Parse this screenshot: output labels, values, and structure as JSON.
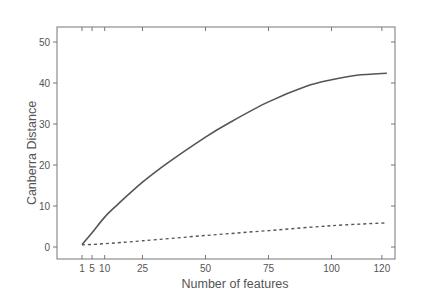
{
  "chart_data": {
    "type": "line",
    "title": "",
    "xlabel": "Number of features",
    "ylabel": "Canberra Distance",
    "xlim": [
      -12,
      135
    ],
    "ylim": [
      -3.5,
      53.5
    ],
    "x_ticks": [
      1,
      5,
      10,
      25,
      50,
      75,
      100,
      120
    ],
    "y_ticks": [
      0,
      10,
      20,
      30,
      40,
      50
    ],
    "grid": false,
    "legend": null,
    "series": [
      {
        "name": "solid",
        "style": "solid",
        "color": "#555555",
        "x": [
          1,
          5,
          10,
          15,
          25,
          35,
          50,
          60,
          75,
          90,
          100,
          110,
          122
        ],
        "values": [
          0.6,
          3.5,
          7.3,
          10.3,
          15.8,
          20.5,
          26.8,
          30.5,
          35.4,
          39.2,
          40.8,
          41.9,
          42.4
        ]
      },
      {
        "name": "dashed",
        "style": "dashed",
        "color": "#555555",
        "x": [
          1,
          10,
          25,
          50,
          75,
          100,
          122
        ],
        "values": [
          0.5,
          0.8,
          1.5,
          2.8,
          4.0,
          5.2,
          5.9
        ]
      }
    ]
  },
  "colors": {
    "axis": "#777777",
    "text": "#555555",
    "background": "#ffffff"
  }
}
